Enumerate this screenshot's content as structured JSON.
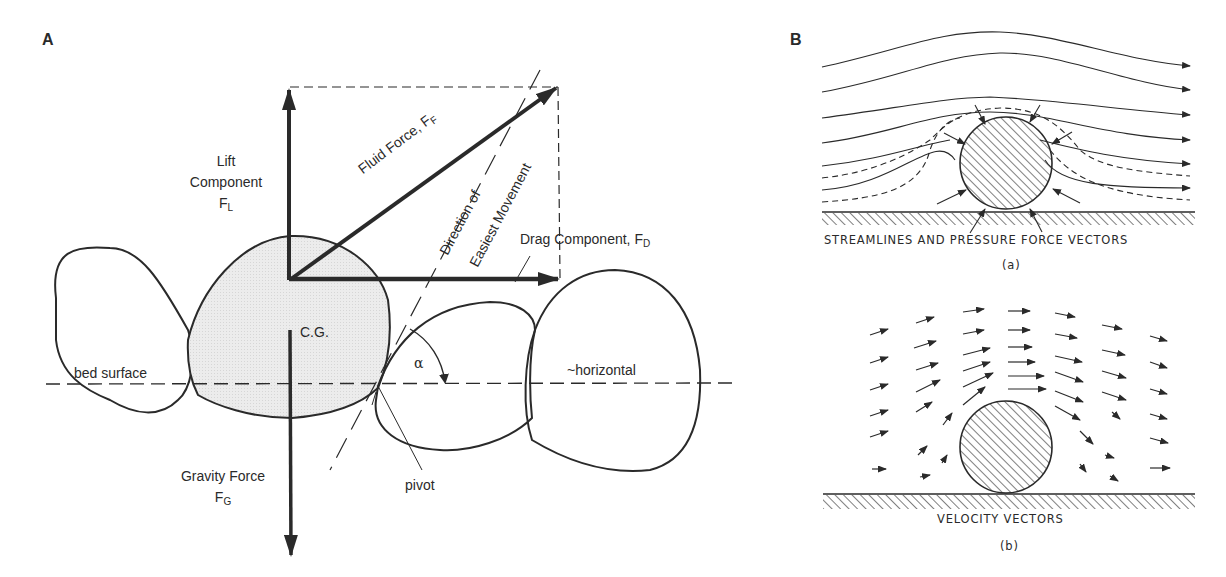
{
  "panel_a": {
    "label": "A",
    "lift": {
      "line1": "Lift",
      "line2": "Component",
      "symbol": "F",
      "sub": "L"
    },
    "fluid": {
      "text": "Fluid Force, F",
      "sub": "F"
    },
    "direction": {
      "line1": "Direction of",
      "line2": "Easiest Movement"
    },
    "drag": {
      "text": "Drag Component, F",
      "sub": "D"
    },
    "cg": "C.G.",
    "bed_surface": "bed surface",
    "alpha": "α",
    "horizontal": "~horizontal",
    "gravity": {
      "line1": "Gravity Force",
      "symbol": "F",
      "sub": "G"
    },
    "pivot": "pivot"
  },
  "panel_b": {
    "label": "B",
    "a_caption": "STREAMLINES AND PRESSURE FORCE VECTORS",
    "a_tag": "(a)",
    "b_caption": "VELOCITY VECTORS",
    "b_tag": "(b)"
  }
}
